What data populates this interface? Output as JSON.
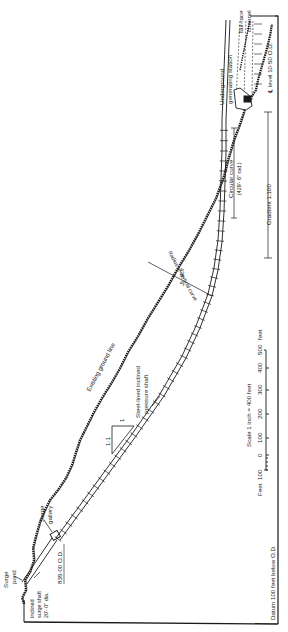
{
  "diagram": {
    "orientation": "rotated 90 degrees (text reads bottom-to-top)",
    "colors": {
      "ink": "#1a1a1a",
      "paper": "#ffffff"
    },
    "labels": {
      "tail_race": [
        "Tail-race",
        "channel"
      ],
      "generating_station": [
        "Underground",
        "generating station"
      ],
      "level": "℄ level 10·50 O.D.",
      "circular_curve": [
        "Circular curve",
        "(429'- 6\" rad.)"
      ],
      "gradient": "Gradient 1:100",
      "vertical_curve_radius": [
        "429'- 6\"",
        "Radius of vertical curve"
      ],
      "existing_ground": "Existing ground line",
      "pressure_shaft": [
        "Steel-lined inclined",
        "pressure shaft"
      ],
      "gradient_triangle": {
        "rise": "1",
        "run": "1·1"
      },
      "surge_gallery": [
        "Surge",
        "gallery"
      ],
      "surge_level": "835·00 O.D.",
      "surge_pond": [
        "Surge",
        "pond"
      ],
      "inclined_surge_shaft": [
        "Inclined",
        "surge shaft",
        "20'- 0\" dia."
      ],
      "datum": "Datum 100 feet below O.D."
    },
    "scale_bar": {
      "title": "Scale   1 inch = 400 feet",
      "unit_left": "Feet",
      "unit_right": "feet",
      "ticks": [
        "100",
        "0",
        "100",
        "200",
        "300",
        "400",
        "500"
      ]
    }
  }
}
